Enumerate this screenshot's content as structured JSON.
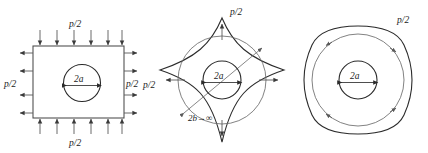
{
  "figure": {
    "type": "technical-diagram",
    "background_color": "#ffffff",
    "line_color": "#4a4a4a",
    "text_color": "#1a1a1a",
    "panels": [
      {
        "id": "panel-1",
        "name": "rectangular-plate-with-hole",
        "shape": "rectangle",
        "hole": {
          "shape": "circle",
          "diameter_label": "2a"
        },
        "load_labels": {
          "top": "p/2",
          "bottom": "p/2",
          "left": "p/2",
          "right": "p/2"
        },
        "load_direction": {
          "top": "inward-down",
          "bottom": "inward-up",
          "left": "outward-left",
          "right": "outward-right"
        },
        "arrow_counts": {
          "top": 6,
          "bottom": 6,
          "left": 4,
          "right": 4
        }
      },
      {
        "id": "panel-2",
        "name": "astroid-boundary-shape",
        "shape": "four-pointed-concave-star",
        "hole": {
          "shape": "circle",
          "diameter_label": "2a"
        },
        "outer_circle": true,
        "diagonal_label": "2b→∞",
        "load_label": "p/2",
        "edge_arrow_labels": {
          "top": "p/2",
          "left": "p/2"
        },
        "edge_arrow_direction": "outward-from-center",
        "arrow_positions": [
          "top",
          "bottom",
          "left",
          "right"
        ]
      },
      {
        "id": "panel-3",
        "name": "squircle-boundary-shape",
        "shape": "rounded-square",
        "hole": {
          "shape": "circle",
          "diameter_label": "2a"
        },
        "inscribed_circle": true,
        "circle_arrow_count": 4,
        "circle_arrow_direction": "clockwise-tangential",
        "load_label": "p/2"
      }
    ],
    "symbols": {
      "half_pressure": "p/2",
      "hole_diameter": "2a",
      "outer_dimension": "2b→∞",
      "infinity": "∞"
    }
  }
}
